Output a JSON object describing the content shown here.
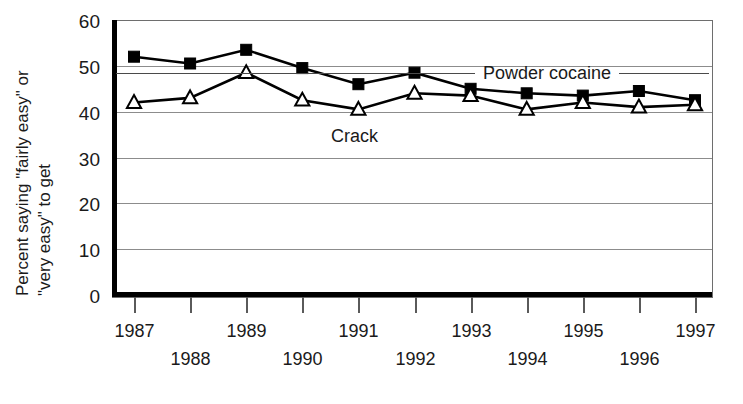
{
  "chart_data": {
    "type": "line",
    "title": "",
    "xlabel": "",
    "ylabel": "Percent saying \"fairly easy\" or \"very easy\" to get",
    "ylabel_line1": "Percent saying \"fairly easy\" or",
    "ylabel_line2": "\"very easy\" to get",
    "categories": [
      "1987",
      "1988",
      "1989",
      "1990",
      "1991",
      "1992",
      "1993",
      "1994",
      "1995",
      "1996",
      "1997"
    ],
    "x": [
      1987,
      1988,
      1989,
      1990,
      1991,
      1992,
      1993,
      1994,
      1995,
      1996,
      1997
    ],
    "ylim": [
      0,
      60
    ],
    "yticks": [
      0,
      10,
      20,
      30,
      40,
      50,
      60
    ],
    "ytick_labels": [
      "0",
      "10",
      "20",
      "30",
      "40",
      "50",
      "60"
    ],
    "xtick_labels_top_row": [
      "1987",
      "",
      "1989",
      "",
      "1991",
      "",
      "1993",
      "",
      "1995",
      "",
      "1997"
    ],
    "xtick_labels_bottom_row": [
      "",
      "1988",
      "",
      "1990",
      "",
      "1992",
      "",
      "1994",
      "",
      "1996",
      ""
    ],
    "grid": true,
    "grid_axis": "y",
    "legend_position": "inline-annotation",
    "series": [
      {
        "name": "Powder cocaine",
        "marker": "filled-square",
        "color": "#000000",
        "values": [
          52.0,
          50.5,
          53.5,
          49.5,
          46.0,
          48.5,
          45.0,
          44.0,
          43.5,
          44.5,
          42.5
        ]
      },
      {
        "name": "Crack",
        "marker": "open-triangle",
        "color": "#000000",
        "values": [
          42.0,
          43.0,
          48.5,
          42.5,
          40.5,
          44.0,
          43.5,
          40.5,
          42.0,
          41.0,
          41.5
        ]
      }
    ],
    "annotations": [
      {
        "text": "Powder cocaine",
        "series": "Powder cocaine",
        "x_px": 483,
        "y_px": 79,
        "leader_left": true,
        "leader_right": true
      },
      {
        "text": "Crack",
        "series": "Crack",
        "x_px": 331,
        "y_px": 142,
        "leader_left": false,
        "leader_right": false
      }
    ]
  },
  "colors": {
    "background": "#ffffff",
    "ink": "#000000",
    "gridline": "#8c8c8c",
    "tick": "#5a5a5a"
  }
}
